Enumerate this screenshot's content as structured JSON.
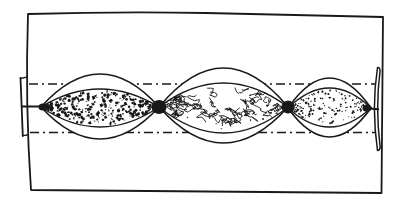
{
  "figure": {
    "ink": "#191919",
    "paper": "#ffffff"
  },
  "block": {
    "outline": "M 28,14 Q 118,11.5 206,13 Q 300,15 383,17 Q 382,100 381.5,193 Q 210,191 31,190 Q 25,104 28,14 Z"
  },
  "envelope_lines": {
    "dash_pattern": "9 4 2 4",
    "top": {
      "x1": 29,
      "y1": 84,
      "x2": 378,
      "y2": 84
    },
    "bottom": {
      "x1": 30,
      "y1": 132.5,
      "x2": 378,
      "y2": 132.5
    }
  },
  "boudins": [
    {
      "name": "left-boudin",
      "texture": "dense-speckle",
      "x1": 41,
      "x2": 159,
      "cy": 107,
      "outer_top": 33,
      "outer_bottom": 32,
      "inner_top": 18,
      "inner_bottom": 20
    },
    {
      "name": "middle-boudin",
      "texture": "vermicular",
      "x1": 159,
      "x2": 288,
      "cy": 107,
      "outer_top": 39,
      "outer_bottom": 36,
      "inner_top": 24,
      "inner_bottom": 26
    },
    {
      "name": "right-boudin",
      "texture": "fine-stipple",
      "x1": 288,
      "x2": 371,
      "cy": 108,
      "outer_top": 30,
      "outer_bottom": 29,
      "inner_top": 20,
      "inner_bottom": 19
    }
  ],
  "textures": {
    "dense-speckle": {
      "kind": "blotch",
      "count": 330,
      "min_size": 0.7,
      "max_size": 2.9,
      "seed": 7
    },
    "vermicular": {
      "kind": "squiggle",
      "count": 48,
      "segments": 4,
      "amplitude": 7,
      "stroke_width": 0.9,
      "extra_dots": 16,
      "seed": 11
    },
    "fine-stipple": {
      "kind": "stipple",
      "count": 165,
      "min_size": 0.5,
      "max_size": 1.1,
      "dash_fraction": 0.12,
      "seed": 23
    }
  },
  "pinch_nodes": [
    {
      "name": "pinch-node-1",
      "cx": 159,
      "cy": 107,
      "rx": 7.5,
      "ry": 7
    },
    {
      "name": "pinch-node-2",
      "cx": 288,
      "cy": 107,
      "rx": 6.5,
      "ry": 6.5
    },
    {
      "name": "left-tip-node",
      "cx": 43,
      "cy": 107,
      "rx": 4.5,
      "ry": 3.5
    },
    {
      "name": "right-tip-node",
      "cx": 367,
      "cy": 108,
      "rx": 4.5,
      "ry": 3.5
    }
  ],
  "left_tab": {
    "strokes": [
      {
        "d": "M 20.5,78 L 22.8,136",
        "w": 1.8
      },
      {
        "d": "M 20.5,78.5 L 26.5,77.2",
        "w": 1.3
      },
      {
        "d": "M 22.8,135.6 L 27.5,135",
        "w": 1.3
      },
      {
        "d": "M 22,106.5 L 41.5,106.5",
        "w": 2.2
      }
    ]
  },
  "right_tab": {
    "sliver": "M 377.5,67.5 Q 371.3,108 377.5,150.5 Q 380.6,149.6 380.1,146.5 Q 375.2,108 380.1,70.5 Q 379.6,66.9 377.5,67.5 Z",
    "strokes": [
      {
        "d": "M 366,108.3 L 378.2,109.3",
        "w": 2.0
      }
    ]
  }
}
